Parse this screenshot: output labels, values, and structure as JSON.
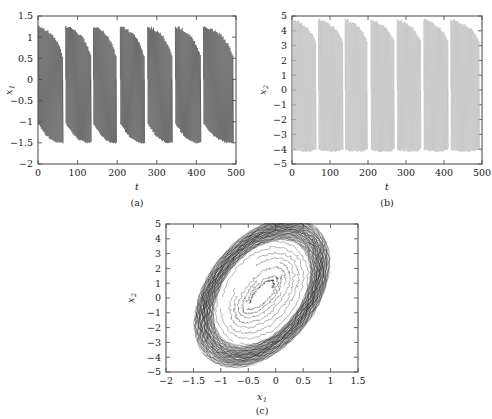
{
  "figure": {
    "background": "#ffffff",
    "ink": "#1a1a1a"
  },
  "panels": [
    {
      "id": "a",
      "caption": "(a)",
      "xlabel": "t",
      "ylabel_base": "x",
      "ylabel_sub": "1"
    },
    {
      "id": "b",
      "caption": "(b)",
      "xlabel": "t",
      "ylabel_base": "x",
      "ylabel_sub": "2"
    },
    {
      "id": "c",
      "caption": "(c)",
      "xlabel_base": "x",
      "xlabel_sub": "1",
      "ylabel_base": "x",
      "ylabel_sub": "2"
    }
  ],
  "chart_data": [
    {
      "type": "line",
      "panel": "a",
      "title": "",
      "xlabel": "t",
      "ylabel": "x1",
      "xlim": [
        0,
        500
      ],
      "ylim": [
        -2,
        1.5
      ],
      "xticks": [
        0,
        100,
        200,
        300,
        400,
        500
      ],
      "xticklabels": [
        "0",
        "100",
        "200",
        "300",
        "400",
        "500"
      ],
      "yticks": [
        -2,
        -1.5,
        -1,
        -0.5,
        0,
        0.5,
        1,
        1.5
      ],
      "yticklabels": [
        "-2",
        "-1.5",
        "-1",
        "-0.5",
        "0",
        "0.5",
        "1",
        "1.5"
      ],
      "grid": false,
      "legend": null,
      "color": "#4a4a4a",
      "description": "Chaotic bursting time series. Seven burst episodes across t=0..500. Within each burst the trajectory oscillates rapidly between an upper envelope near 1.25 and a lower envelope near -1.5; spike amplitude decays through each burst and resets at the burst boundary.",
      "burst_starts": [
        0,
        70,
        140,
        208,
        277,
        347,
        418
      ],
      "burst_ends": [
        62,
        133,
        197,
        268,
        338,
        410,
        492
      ],
      "spike_upper_envelope": [
        1.25,
        1.22,
        1.18,
        1.12,
        1.05,
        0.95,
        0.8,
        0.55
      ],
      "spike_lower_envelope": [
        -1.05,
        -1.18,
        -1.3,
        -1.38,
        -1.44,
        -1.48,
        -1.5,
        -1.5
      ],
      "baseline": 0.0
    },
    {
      "type": "line",
      "panel": "b",
      "title": "",
      "xlabel": "t",
      "ylabel": "x2",
      "xlim": [
        0,
        500
      ],
      "ylim": [
        -5,
        5
      ],
      "xticks": [
        0,
        100,
        200,
        300,
        400,
        500
      ],
      "xticklabels": [
        "0",
        "100",
        "200",
        "300",
        "400",
        "500"
      ],
      "yticks": [
        -5,
        -4,
        -3,
        -2,
        -1,
        0,
        1,
        2,
        3,
        4,
        5
      ],
      "yticklabels": [
        "-5",
        "-4",
        "-3",
        "-2",
        "-1",
        "0",
        "1",
        "2",
        "3",
        "4",
        "5"
      ],
      "grid": false,
      "legend": null,
      "color": "#b8b8b8",
      "description": "Chaotic bursting time series of the second state variable, rendered in light gray. Seven bursts aligned with panel (a). Spikes span roughly -4.1 to 4.75, with the upper envelope decaying within each burst.",
      "burst_starts": [
        0,
        70,
        140,
        208,
        277,
        347,
        418
      ],
      "burst_ends": [
        62,
        133,
        197,
        268,
        338,
        410,
        492
      ],
      "spike_upper_envelope": [
        4.75,
        4.7,
        4.6,
        4.45,
        4.3,
        4.1,
        3.8,
        3.3
      ],
      "spike_lower_envelope": [
        -4.05,
        -4.1,
        -4.12,
        -4.14,
        -4.15,
        -4.15,
        -4.1,
        -4.0
      ],
      "baseline": 0.0
    },
    {
      "type": "line",
      "panel": "c",
      "title": "",
      "xlabel": "x1",
      "ylabel": "x2",
      "xlim": [
        -2,
        1.5
      ],
      "ylim": [
        -5,
        5
      ],
      "xticks": [
        -2,
        -1.5,
        -1,
        -0.5,
        0,
        0.5,
        1,
        1.5
      ],
      "xticklabels": [
        "-2",
        "-1.5",
        "-1",
        "-0.5",
        "0",
        "0.5",
        "1",
        "1.5"
      ],
      "yticks": [
        -5,
        -4,
        -3,
        -2,
        -1,
        0,
        1,
        2,
        3,
        4,
        5
      ],
      "yticklabels": [
        "-5",
        "-4",
        "-3",
        "-2",
        "-1",
        "0",
        "1",
        "2",
        "3",
        "4",
        "5"
      ],
      "grid": false,
      "legend": null,
      "color": "#1a1a1a",
      "description": "Phase-plane projection (x1, x2) of the chaotic attractor. A dense, thick band of overlapping orbits forms a tilted ellipse whose major axis runs from lower-left to upper-right. The outer band is nearly black from trajectory overlap; the interior is mostly empty except for a few sparse transient orbits that cut across the middle.",
      "attractor": {
        "shape": "tilted-elliptical-band",
        "center": [
          -0.25,
          0.35
        ],
        "semi_major": 3.9,
        "semi_minor": 1.25,
        "tilt_degrees": -62,
        "band_thickness": 0.55,
        "n_outer_orbits": 46,
        "n_inner_transients": 9,
        "extent_x": [
          -1.62,
          1.3
        ],
        "extent_y": [
          -4.1,
          4.95
        ]
      }
    }
  ]
}
